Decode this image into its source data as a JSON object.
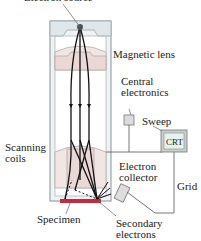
{
  "diagram": {
    "labels": {
      "electron_source": "Electron source",
      "magnetic_lens": "Magnetic lens",
      "central_electronics_1": "Central",
      "central_electronics_2": "electronics",
      "sweep": "Sweep",
      "crt": "CRT",
      "scanning_coils_1": "Scanning",
      "scanning_coils_2": "coils",
      "electron_collector_1": "Electron",
      "electron_collector_2": "collector",
      "grid": "Grid",
      "specimen": "Specimen",
      "secondary_electrons_1": "Secondary",
      "secondary_electrons_2": "electrons"
    },
    "colors": {
      "column_fill": "#e8edef",
      "column_stroke": "#9aa4a8",
      "lens_fill": "#efe0df",
      "specimen": "#c8283c",
      "beam": "#111111",
      "crt_screen": "#e6f2ee"
    }
  }
}
